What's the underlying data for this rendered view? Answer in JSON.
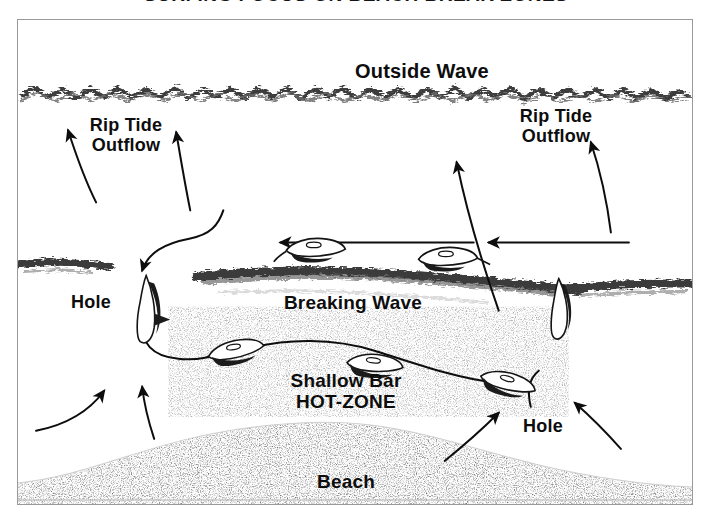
{
  "title": {
    "text": "SURFING FOCUS ON BEACH BREAK ZONES",
    "note": "clipped at top edge"
  },
  "diagram": {
    "type": "beach-break-surf-zone-diagram",
    "labels": {
      "outside_wave": "Outside Wave",
      "rip_tide_outflow_left_line1": "Rip Tide",
      "rip_tide_outflow_left_line2": "Outflow",
      "rip_tide_outflow_right_line1": "Rip Tide",
      "rip_tide_outflow_right_line2": "Outflow",
      "hole_left": "Hole",
      "breaking_wave": "Breaking Wave",
      "shallow_bar_line1": "Shallow Bar",
      "shallow_bar_line2": "HOT-ZONE",
      "hole_right": "Hole",
      "beach": "Beach"
    },
    "colors": {
      "ink": "#0d0d0d",
      "frame_border": "#9a9a9a",
      "background": "#ffffff",
      "foam_gray": "#4a4a4a",
      "sand_stipple": "#b9b9b9"
    },
    "elements": {
      "outside_wave_line": "jagged foam band spanning full width near top",
      "breaking_wave_line": "broad foam band across center",
      "left_shore_streak": "short foam streak at left edge mid-height",
      "right_shore_streak": "foam streak at right edge mid-height",
      "beach_mound": "stippled sand mound along bottom",
      "surfers_paddling_out": 2,
      "surfers_on_bar": 3,
      "surfers_standing_in_holes": 2,
      "flow_arrows": 10
    }
  }
}
